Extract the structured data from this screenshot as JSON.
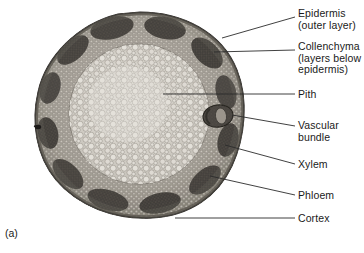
{
  "figure": {
    "caption": "(a)",
    "specimen": "dicot stem cross section light micrograph",
    "colors": {
      "background": "#ffffff",
      "text": "#1a1a1a",
      "leader_line": "#2b2b2b",
      "epidermis": "#6b6660",
      "collenchyma": "#4a4541",
      "cortex": "#8d8880",
      "pith": "#cfcbc3",
      "vascular_bundle": "#3f3a36",
      "xylem": "#8a847c",
      "phloem": "#5a544e"
    }
  },
  "labels": [
    {
      "name": "epidermis",
      "lines": [
        "Epidermis",
        "(outer layer)"
      ],
      "text": "Epidermis\n(outer layer)",
      "x": 298,
      "y": 8,
      "leader": {
        "x1": 295,
        "y1": 17,
        "x2": 222,
        "y2": 38
      }
    },
    {
      "name": "collenchyma",
      "lines": [
        "Collenchyma",
        "(layers below",
        "epidermis)"
      ],
      "text": "Collenchyma\n(layers below\nepidermis)",
      "x": 298,
      "y": 41,
      "leader": {
        "x1": 295,
        "y1": 50,
        "x2": 214,
        "y2": 52
      }
    },
    {
      "name": "pith",
      "lines": [
        "Pith"
      ],
      "text": "Pith",
      "x": 298,
      "y": 89,
      "leader": {
        "x1": 295,
        "y1": 94,
        "x2": 163,
        "y2": 94
      }
    },
    {
      "name": "vascular-bundle",
      "lines": [
        "Vascular",
        "bundle"
      ],
      "text": "Vascular\nbundle",
      "x": 298,
      "y": 120,
      "leader": {
        "x1": 295,
        "y1": 126,
        "x2": 232,
        "y2": 115
      }
    },
    {
      "name": "xylem",
      "lines": [
        "Xylem"
      ],
      "text": "Xylem",
      "x": 298,
      "y": 159,
      "leader": {
        "x1": 295,
        "y1": 164,
        "x2": 225,
        "y2": 145
      }
    },
    {
      "name": "phloem",
      "lines": [
        "Phloem"
      ],
      "text": "Phloem",
      "x": 298,
      "y": 190,
      "leader": {
        "x1": 295,
        "y1": 195,
        "x2": 210,
        "y2": 176
      }
    },
    {
      "name": "cortex",
      "lines": [
        "Cortex"
      ],
      "text": "Cortex",
      "x": 298,
      "y": 213,
      "leader": {
        "x1": 295,
        "y1": 218,
        "x2": 175,
        "y2": 218
      }
    }
  ]
}
